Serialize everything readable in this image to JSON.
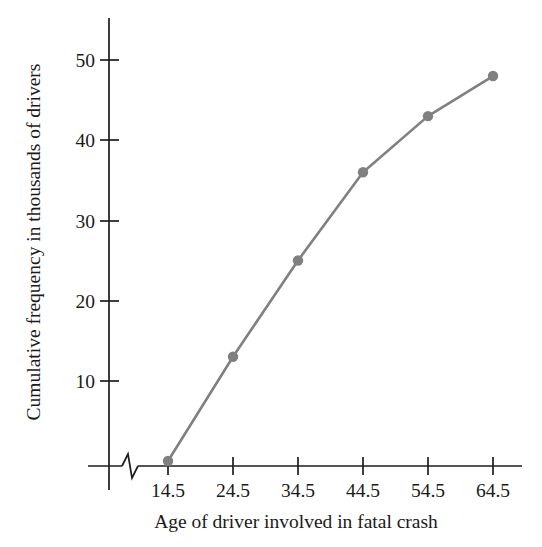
{
  "chart_data": {
    "type": "line",
    "title": "",
    "xlabel": "Age of driver involved in fatal crash",
    "ylabel": "Cumulative frequency in thousands of drivers",
    "categories": [
      "14.5",
      "24.5",
      "34.5",
      "44.5",
      "54.5",
      "64.5"
    ],
    "x": [
      14.5,
      24.5,
      34.5,
      44.5,
      54.5,
      64.5
    ],
    "values": [
      0,
      13,
      25,
      36,
      43,
      48
    ],
    "series": [
      {
        "name": "Cumulative frequency",
        "values": [
          0,
          13,
          25,
          36,
          43,
          48
        ]
      }
    ],
    "xtick_labels": [
      "14.5",
      "24.5",
      "34.5",
      "44.5",
      "54.5",
      "64.5"
    ],
    "ytick_labels": [
      "10",
      "20",
      "30",
      "40",
      "50"
    ],
    "ytick_values": [
      10,
      20,
      30,
      40,
      50
    ],
    "ylim": [
      0,
      55
    ],
    "xlim": [
      14.5,
      64.5
    ],
    "grid": false,
    "legend": false,
    "legend_position": "none",
    "axis_break": true,
    "axis_break_axis": "x",
    "marker": "circle",
    "colors": {
      "line": "#808080",
      "marker": "#808080",
      "axis": "#1d1d1d",
      "text": "#1a1a1a",
      "background": "#ffffff"
    }
  }
}
